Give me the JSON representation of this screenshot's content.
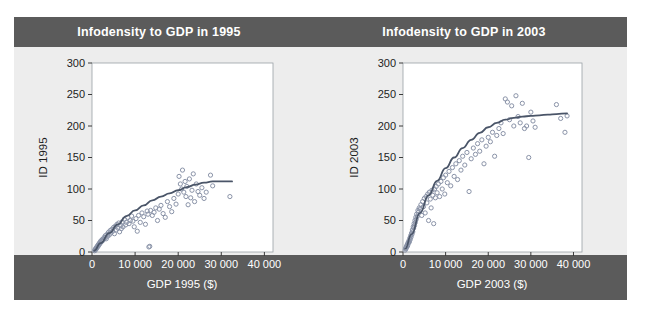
{
  "figure": {
    "background": "#ffffff",
    "banner_color": "#5b5b5b",
    "panel_color": "#ededed",
    "plot_face_color": "#ffffff",
    "marker_color": "#8a93a8",
    "curve_color": "#4a5568",
    "axis_color": "#9aa0a6"
  },
  "panels": {
    "left": {
      "title": "Infodensity to GDP in 1995",
      "xlabel": "GDP 1995 ($)",
      "ylabel": "ID 1995"
    },
    "right": {
      "title": "Infodensity to GDP in 2003",
      "xlabel": "GDP 2003 ($)",
      "ylabel": "ID 2003"
    }
  },
  "chart_data": [
    {
      "type": "scatter",
      "title": "Infodensity to GDP in 1995",
      "xlabel": "GDP 1995 ($)",
      "ylabel": "ID 1995",
      "xlim": [
        0,
        42000
      ],
      "ylim": [
        0,
        300
      ],
      "xticks": [
        0,
        10000,
        20000,
        30000,
        40000
      ],
      "xticklabels": [
        "0",
        "10 000",
        "20 000",
        "30 000",
        "40 000"
      ],
      "yticks": [
        0,
        50,
        100,
        150,
        200,
        250,
        300
      ],
      "yticklabels": [
        "0",
        "50",
        "100",
        "150",
        "200",
        "250",
        "300"
      ],
      "grid": false,
      "legend": "none",
      "marker": "open-circle",
      "points": [
        [
          600,
          2
        ],
        [
          700,
          4
        ],
        [
          800,
          3
        ],
        [
          900,
          6
        ],
        [
          1000,
          5
        ],
        [
          1100,
          8
        ],
        [
          1200,
          7
        ],
        [
          1300,
          10
        ],
        [
          1400,
          9
        ],
        [
          1500,
          12
        ],
        [
          1600,
          11
        ],
        [
          1700,
          14
        ],
        [
          1800,
          13
        ],
        [
          1900,
          16
        ],
        [
          2000,
          15
        ],
        [
          2100,
          18
        ],
        [
          2300,
          17
        ],
        [
          2400,
          20
        ],
        [
          2600,
          19
        ],
        [
          2800,
          23
        ],
        [
          3000,
          22
        ],
        [
          3100,
          26
        ],
        [
          3300,
          21
        ],
        [
          3500,
          28
        ],
        [
          3600,
          25
        ],
        [
          3800,
          31
        ],
        [
          4000,
          27
        ],
        [
          4200,
          34
        ],
        [
          4400,
          30
        ],
        [
          4600,
          36
        ],
        [
          4800,
          33
        ],
        [
          5000,
          39
        ],
        [
          5200,
          29
        ],
        [
          5400,
          41
        ],
        [
          5600,
          35
        ],
        [
          5800,
          44
        ],
        [
          6000,
          38
        ],
        [
          6200,
          46
        ],
        [
          6400,
          32
        ],
        [
          6600,
          42
        ],
        [
          6800,
          37
        ],
        [
          7000,
          48
        ],
        [
          7200,
          40
        ],
        [
          7500,
          52
        ],
        [
          7800,
          43
        ],
        [
          8000,
          47
        ],
        [
          8300,
          55
        ],
        [
          8600,
          45
        ],
        [
          8900,
          50
        ],
        [
          9200,
          57
        ],
        [
          9500,
          49
        ],
        [
          9800,
          40
        ],
        [
          10200,
          53
        ],
        [
          10500,
          33
        ],
        [
          10800,
          58
        ],
        [
          11200,
          47
        ],
        [
          11600,
          62
        ],
        [
          12000,
          56
        ],
        [
          12400,
          44
        ],
        [
          12800,
          65
        ],
        [
          13000,
          60
        ],
        [
          13200,
          8
        ],
        [
          13400,
          9
        ],
        [
          13600,
          66
        ],
        [
          14000,
          58
        ],
        [
          14400,
          63
        ],
        [
          14800,
          70
        ],
        [
          15200,
          50
        ],
        [
          15600,
          68
        ],
        [
          16000,
          74
        ],
        [
          16500,
          61
        ],
        [
          17000,
          55
        ],
        [
          17500,
          80
        ],
        [
          18000,
          72
        ],
        [
          18500,
          64
        ],
        [
          19000,
          85
        ],
        [
          19500,
          76
        ],
        [
          20000,
          92
        ],
        [
          20200,
          120
        ],
        [
          20500,
          108
        ],
        [
          20800,
          100
        ],
        [
          21000,
          130
        ],
        [
          21300,
          95
        ],
        [
          21600,
          112
        ],
        [
          21800,
          88
        ],
        [
          22000,
          104
        ],
        [
          22300,
          75
        ],
        [
          22600,
          116
        ],
        [
          22900,
          86
        ],
        [
          23200,
          98
        ],
        [
          23500,
          124
        ],
        [
          23800,
          80
        ],
        [
          24200,
          108
        ],
        [
          24600,
          96
        ],
        [
          25000,
          90
        ],
        [
          25500,
          102
        ],
        [
          26000,
          85
        ],
        [
          26500,
          95
        ],
        [
          27500,
          122
        ],
        [
          28000,
          105
        ],
        [
          32000,
          88
        ]
      ],
      "fit_curve": {
        "label": "smoothed fit",
        "points": [
          [
            500,
            2
          ],
          [
            2000,
            14
          ],
          [
            4000,
            30
          ],
          [
            6000,
            44
          ],
          [
            8000,
            57
          ],
          [
            10000,
            66
          ],
          [
            12000,
            74
          ],
          [
            14000,
            82
          ],
          [
            16000,
            88
          ],
          [
            18000,
            93
          ],
          [
            20000,
            98
          ],
          [
            22000,
            103
          ],
          [
            24000,
            107
          ],
          [
            26000,
            110
          ],
          [
            28000,
            112
          ],
          [
            30000,
            112
          ],
          [
            32500,
            112
          ]
        ]
      }
    },
    {
      "type": "scatter",
      "title": "Infodensity to GDP in 2003",
      "xlabel": "GDP 2003 ($)",
      "ylabel": "ID 2003",
      "xlim": [
        0,
        42000
      ],
      "ylim": [
        0,
        300
      ],
      "xticks": [
        0,
        10000,
        20000,
        30000,
        40000
      ],
      "xticklabels": [
        "0",
        "10 000",
        "20 000",
        "30 000",
        "40 000"
      ],
      "yticks": [
        0,
        50,
        100,
        150,
        200,
        250,
        300
      ],
      "yticklabels": [
        "0",
        "50",
        "100",
        "150",
        "200",
        "250",
        "300"
      ],
      "grid": false,
      "legend": "none",
      "marker": "open-circle",
      "points": [
        [
          500,
          3
        ],
        [
          600,
          6
        ],
        [
          700,
          5
        ],
        [
          800,
          9
        ],
        [
          900,
          8
        ],
        [
          1000,
          12
        ],
        [
          1100,
          10
        ],
        [
          1200,
          15
        ],
        [
          1300,
          14
        ],
        [
          1400,
          18
        ],
        [
          1500,
          16
        ],
        [
          1600,
          22
        ],
        [
          1700,
          20
        ],
        [
          1800,
          26
        ],
        [
          1900,
          24
        ],
        [
          2000,
          30
        ],
        [
          2100,
          28
        ],
        [
          2200,
          35
        ],
        [
          2300,
          32
        ],
        [
          2400,
          40
        ],
        [
          2500,
          38
        ],
        [
          2600,
          45
        ],
        [
          2700,
          42
        ],
        [
          2800,
          50
        ],
        [
          2900,
          47
        ],
        [
          3000,
          55
        ],
        [
          3100,
          52
        ],
        [
          3200,
          60
        ],
        [
          3400,
          57
        ],
        [
          3500,
          66
        ],
        [
          3600,
          63
        ],
        [
          3800,
          70
        ],
        [
          4000,
          68
        ],
        [
          4200,
          75
        ],
        [
          4400,
          58
        ],
        [
          4600,
          80
        ],
        [
          4800,
          72
        ],
        [
          5000,
          85
        ],
        [
          5200,
          62
        ],
        [
          5400,
          88
        ],
        [
          5600,
          78
        ],
        [
          5800,
          92
        ],
        [
          6000,
          50
        ],
        [
          6200,
          95
        ],
        [
          6400,
          84
        ],
        [
          6600,
          70
        ],
        [
          6800,
          98
        ],
        [
          7000,
          90
        ],
        [
          7200,
          45
        ],
        [
          7400,
          100
        ],
        [
          7600,
          86
        ],
        [
          7800,
          104
        ],
        [
          8000,
          94
        ],
        [
          8300,
          108
        ],
        [
          8600,
          88
        ],
        [
          8900,
          112
        ],
        [
          9200,
          100
        ],
        [
          9500,
          118
        ],
        [
          9800,
          92
        ],
        [
          10000,
          122
        ],
        [
          10400,
          110
        ],
        [
          10800,
          128
        ],
        [
          11200,
          105
        ],
        [
          11600,
          134
        ],
        [
          12000,
          120
        ],
        [
          12400,
          140
        ],
        [
          12800,
          115
        ],
        [
          13200,
          145
        ],
        [
          13600,
          130
        ],
        [
          14000,
          152
        ],
        [
          14500,
          138
        ],
        [
          15000,
          158
        ],
        [
          15500,
          96
        ],
        [
          16000,
          148
        ],
        [
          16500,
          165
        ],
        [
          17000,
          155
        ],
        [
          17500,
          172
        ],
        [
          18000,
          160
        ],
        [
          18500,
          178
        ],
        [
          19000,
          140
        ],
        [
          19500,
          168
        ],
        [
          20000,
          182
        ],
        [
          20500,
          175
        ],
        [
          21000,
          190
        ],
        [
          21500,
          152
        ],
        [
          22000,
          185
        ],
        [
          22500,
          196
        ],
        [
          23000,
          205
        ],
        [
          23500,
          188
        ],
        [
          24000,
          243
        ],
        [
          24500,
          238
        ],
        [
          25000,
          210
        ],
        [
          25500,
          232
        ],
        [
          26000,
          200
        ],
        [
          26500,
          248
        ],
        [
          27000,
          215
        ],
        [
          27500,
          205
        ],
        [
          28000,
          236
        ],
        [
          28500,
          196
        ],
        [
          29000,
          200
        ],
        [
          29500,
          150
        ],
        [
          30000,
          222
        ],
        [
          30500,
          208
        ],
        [
          31000,
          198
        ],
        [
          36000,
          234
        ],
        [
          37000,
          212
        ],
        [
          38000,
          190
        ],
        [
          38500,
          216
        ]
      ],
      "fit_curve": {
        "label": "smoothed fit",
        "points": [
          [
            500,
            5
          ],
          [
            2000,
            28
          ],
          [
            4000,
            62
          ],
          [
            6000,
            90
          ],
          [
            8000,
            113
          ],
          [
            10000,
            133
          ],
          [
            12000,
            150
          ],
          [
            14000,
            165
          ],
          [
            16000,
            178
          ],
          [
            18000,
            189
          ],
          [
            20000,
            198
          ],
          [
            22000,
            205
          ],
          [
            24000,
            210
          ],
          [
            26000,
            213
          ],
          [
            28000,
            215
          ],
          [
            30000,
            216
          ],
          [
            32000,
            217
          ],
          [
            34000,
            218
          ],
          [
            36000,
            219
          ],
          [
            38500,
            220
          ]
        ]
      }
    }
  ]
}
